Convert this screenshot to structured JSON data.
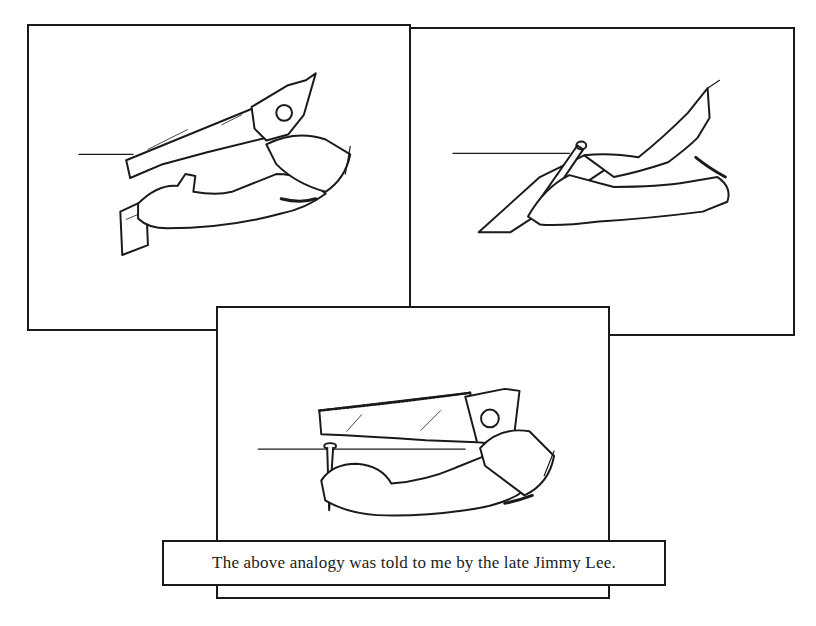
{
  "panels": [
    {
      "id": "panel-1",
      "description": "Hand sawing a board held by the other hand"
    },
    {
      "id": "panel-2",
      "description": "Hand marking a line with a pencil along a board"
    },
    {
      "id": "panel-3",
      "description": "Hand sawing toward a nail held upright by the other hand"
    }
  ],
  "caption": {
    "text": "The above analogy was told to me by the late Jimmy Lee."
  },
  "colors": {
    "ink": "#1a1a1a",
    "paper": "#ffffff"
  }
}
